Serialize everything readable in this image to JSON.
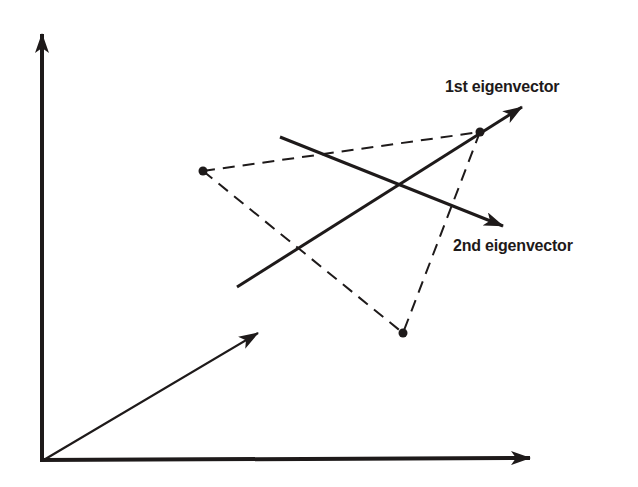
{
  "diagram": {
    "colors": {
      "ink": "#1e1a1a",
      "background": "#ffffff"
    },
    "axes": {
      "origin": [
        42,
        461
      ],
      "y_axis_tip": [
        42,
        33
      ],
      "x_axis_tip": [
        530,
        459
      ]
    },
    "origin_vector": {
      "from": [
        42,
        461
      ],
      "to": [
        258,
        333
      ]
    },
    "points": [
      {
        "name": "point-a",
        "x": 203,
        "y": 171
      },
      {
        "name": "point-b",
        "x": 480,
        "y": 132
      },
      {
        "name": "point-c",
        "x": 403,
        "y": 333
      }
    ],
    "eigenvectors": [
      {
        "label": "1st eigenvector",
        "from": [
          237,
          287
        ],
        "to": [
          522,
          107
        ]
      },
      {
        "label": "2nd eigenvector",
        "from": [
          280,
          137
        ],
        "to": [
          503,
          226
        ]
      }
    ],
    "labels": {
      "first": "1st eigenvector",
      "second": "2nd eigenvector"
    }
  }
}
